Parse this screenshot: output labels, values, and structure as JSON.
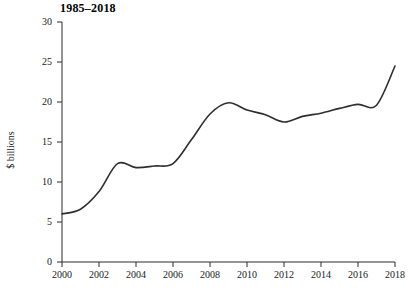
{
  "chart_data": {
    "type": "line",
    "title": "1985–2018",
    "xlabel": "",
    "ylabel": "$ billions",
    "xlim": [
      2000,
      2018
    ],
    "ylim": [
      0,
      30
    ],
    "grid": false,
    "legend": "none",
    "y_ticks": [
      "0",
      "5",
      "10",
      "15",
      "20",
      "25",
      "30"
    ],
    "y_tick_values": [
      0,
      5,
      10,
      15,
      20,
      25,
      30
    ],
    "x_ticks": [
      "2000",
      "2002",
      "2004",
      "2006",
      "2008",
      "2010",
      "2012",
      "2014",
      "2016",
      "2018"
    ],
    "x_tick_values": [
      2000,
      2002,
      2004,
      2006,
      2008,
      2010,
      2012,
      2014,
      2016,
      2018
    ],
    "x": [
      2000,
      2001,
      2002,
      2003,
      2004,
      2005,
      2006,
      2007,
      2008,
      2009,
      2010,
      2011,
      2012,
      2013,
      2014,
      2015,
      2016,
      2017,
      2018
    ],
    "values": [
      6.0,
      6.6,
      8.8,
      12.3,
      11.8,
      12.0,
      12.3,
      15.3,
      18.5,
      19.9,
      19.0,
      18.4,
      17.5,
      18.2,
      18.6,
      19.2,
      19.7,
      19.6,
      24.5
    ],
    "series": [
      {
        "name": "$ billions",
        "values": [
          6.0,
          6.6,
          8.8,
          12.3,
          11.8,
          12.0,
          12.3,
          15.3,
          18.5,
          19.9,
          19.0,
          18.4,
          17.5,
          18.2,
          18.6,
          19.2,
          19.7,
          19.6,
          24.5
        ],
        "color": "#2e2e2e"
      }
    ],
    "line_color": "#2e2e2e",
    "background_color": "#ffffff",
    "axis_color": "#2b2b2b"
  }
}
